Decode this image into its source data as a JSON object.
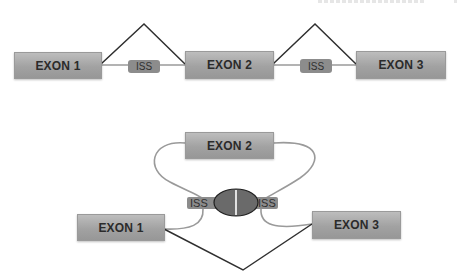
{
  "header": {
    "cropped_text": ""
  },
  "top_diagram": {
    "exons": [
      {
        "label": "EXON 1"
      },
      {
        "label": "EXON 2"
      },
      {
        "label": "EXON 3"
      }
    ],
    "iss": [
      {
        "label": "ISS"
      },
      {
        "label": "ISS"
      }
    ]
  },
  "bottom_diagram": {
    "exons": [
      {
        "label": "EXON 2"
      },
      {
        "label": "EXON 1"
      },
      {
        "label": "EXON 3"
      }
    ],
    "iss": [
      {
        "label": "ISS"
      },
      {
        "label": "ISS"
      }
    ]
  },
  "colors": {
    "exon_fill": "#a6a6a6",
    "iss_fill": "#8c8c8c",
    "intron_line": "#9a9a9a",
    "splice_line": "#2f2f2f",
    "protein_fill": "#6a6a6a"
  }
}
